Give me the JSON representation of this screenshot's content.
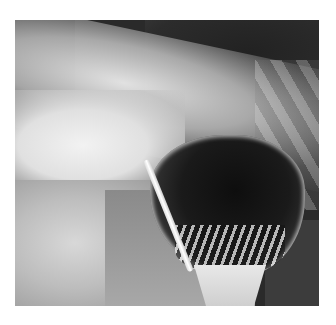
{
  "figure": {
    "colors": {
      "background": "#ffffff",
      "dark_region": "#1e1e1e",
      "bright_region": "#f2f2f2"
    }
  }
}
